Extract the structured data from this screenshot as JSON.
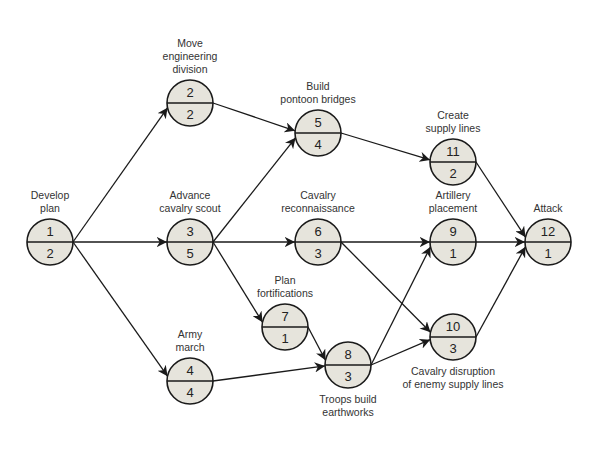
{
  "diagram": {
    "type": "activity-on-node network",
    "nodes": [
      {
        "id": "1",
        "duration": "2",
        "label": [
          "Develop",
          "plan"
        ],
        "cx": 50,
        "cy": 242,
        "label_pos": "above"
      },
      {
        "id": "2",
        "duration": "2",
        "label": [
          "Move",
          "engineering",
          "division"
        ],
        "cx": 190,
        "cy": 103,
        "label_pos": "above"
      },
      {
        "id": "3",
        "duration": "5",
        "label": [
          "Advance",
          "cavalry scout"
        ],
        "cx": 190,
        "cy": 242,
        "label_pos": "above"
      },
      {
        "id": "4",
        "duration": "4",
        "label": [
          "Army",
          "march"
        ],
        "cx": 190,
        "cy": 381,
        "label_pos": "above"
      },
      {
        "id": "5",
        "duration": "4",
        "label": [
          "Build",
          "pontoon bridges"
        ],
        "cx": 318,
        "cy": 133,
        "label_pos": "above"
      },
      {
        "id": "6",
        "duration": "3",
        "label": [
          "Cavalry",
          "reconnaissance"
        ],
        "cx": 318,
        "cy": 242,
        "label_pos": "above"
      },
      {
        "id": "7",
        "duration": "1",
        "label": [
          "Plan",
          "fortifications"
        ],
        "cx": 285,
        "cy": 327,
        "label_pos": "above"
      },
      {
        "id": "8",
        "duration": "3",
        "label": [
          "Troops build",
          "earthworks"
        ],
        "cx": 348,
        "cy": 365,
        "label_pos": "below"
      },
      {
        "id": "9",
        "duration": "1",
        "label": [
          "Artillery",
          "placement"
        ],
        "cx": 453,
        "cy": 242,
        "label_pos": "above"
      },
      {
        "id": "10",
        "duration": "3",
        "label": [
          "Cavalry disruption",
          "of enemy supply lines"
        ],
        "cx": 453,
        "cy": 337,
        "label_pos": "below"
      },
      {
        "id": "11",
        "duration": "2",
        "label": [
          "Create",
          "supply lines"
        ],
        "cx": 453,
        "cy": 162,
        "label_pos": "above"
      },
      {
        "id": "12",
        "duration": "1",
        "label": [
          "Attack"
        ],
        "cx": 548,
        "cy": 242,
        "label_pos": "above"
      }
    ],
    "edges": [
      [
        "1",
        "2"
      ],
      [
        "1",
        "3"
      ],
      [
        "1",
        "4"
      ],
      [
        "2",
        "5"
      ],
      [
        "3",
        "5"
      ],
      [
        "3",
        "6"
      ],
      [
        "3",
        "7"
      ],
      [
        "4",
        "8"
      ],
      [
        "7",
        "8"
      ],
      [
        "5",
        "11"
      ],
      [
        "6",
        "9"
      ],
      [
        "6",
        "10"
      ],
      [
        "8",
        "9"
      ],
      [
        "8",
        "10"
      ],
      [
        "11",
        "12"
      ],
      [
        "9",
        "12"
      ],
      [
        "10",
        "12"
      ]
    ],
    "colors": {
      "node_fill": "#e6e4dc",
      "stroke": "#1a1a1a",
      "text": "#333333"
    }
  }
}
